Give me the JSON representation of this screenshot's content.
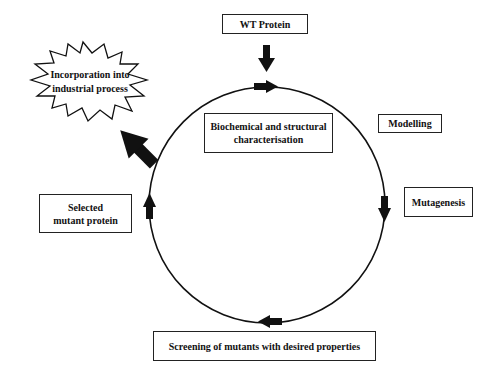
{
  "diagram": {
    "type": "cycle",
    "nodes": {
      "wt_protein": "WT Protein",
      "characterisation": [
        "Biochemical and structural",
        "characterisation"
      ],
      "modelling": "Modelling",
      "mutagenesis": "Mutagenesis",
      "screening": "Screening of mutants with desired properties",
      "selected": [
        "Selected",
        "mutant protein"
      ],
      "industrial": [
        "Incorporation into",
        "industrial process"
      ]
    },
    "flow": [
      "WT Protein",
      "Biochemical and structural characterisation",
      "Modelling",
      "Mutagenesis",
      "Screening of mutants with desired properties",
      "Selected mutant protein",
      "Incorporation into industrial process"
    ],
    "colors": {
      "line": "#111111",
      "background": "#ffffff"
    }
  }
}
